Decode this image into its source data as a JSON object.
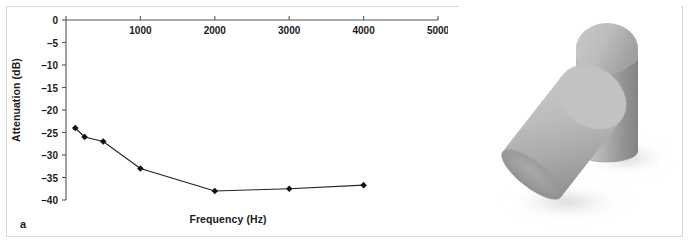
{
  "figure": {
    "panels": [
      {
        "letter": "a",
        "kind": "chart"
      },
      {
        "letter": "b",
        "kind": "photograph"
      }
    ],
    "border_color": "#d8d8d8",
    "background": "#ffffff"
  },
  "chart_data": {
    "type": "line",
    "title": "",
    "xlabel": "Frequency (Hz)",
    "ylabel": "Attenuation (dB)",
    "x": [
      125,
      250,
      500,
      1000,
      2000,
      3000,
      4000
    ],
    "values": [
      -24,
      -26,
      -27,
      -33,
      -38,
      -37.5,
      -36.7
    ],
    "xlim": [
      0,
      5000
    ],
    "ylim": [
      -40,
      0
    ],
    "x_ticks": [
      0,
      1000,
      2000,
      3000,
      4000,
      5000
    ],
    "x_tick_labels": [
      "",
      "1000",
      "2000",
      "3000",
      "4000",
      "5000"
    ],
    "y_ticks": [
      0,
      -5,
      -10,
      -15,
      -20,
      -25,
      -30,
      -35,
      -40
    ],
    "y_tick_labels": [
      "0",
      "–5",
      "–10",
      "–15",
      "–20",
      "–25",
      "–30",
      "–35",
      "–40"
    ],
    "x_axis_position": "top",
    "grid": false,
    "legend": false,
    "marker": "diamond",
    "marker_color": "#111111",
    "line_color": "#222222",
    "axis_color": "#555555"
  },
  "photograph": {
    "subject": "two gray foam earplugs",
    "description": "One cylindrical foam earplug standing upright and one lying tilted in front of it on a white background",
    "colors": {
      "foam_light": "#c2c2c2",
      "foam_mid": "#a9a9a9",
      "foam_dark": "#8b8b8b",
      "foam_shadow": "#6f6f6f",
      "cast_shadow": "#d5d5d5",
      "background": "#ffffff"
    }
  }
}
